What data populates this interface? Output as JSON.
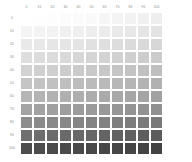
{
  "chart_data": {
    "type": "heatmap",
    "title": "",
    "subtitle": "",
    "xlabel": "",
    "ylabel": "",
    "legend": "none",
    "grid": false,
    "colormap": "greys",
    "colormap_min_hex": "#ffffff",
    "colormap_max_hex": "#454545",
    "x_axis_position": "top",
    "y_axis_position": "left",
    "xlim": [
      0,
      100
    ],
    "ylim": [
      0,
      100
    ],
    "categories": [
      "0",
      "10",
      "20",
      "30",
      "40",
      "50",
      "60",
      "70",
      "80",
      "90",
      "100"
    ],
    "row_categories": [
      "0",
      "10",
      "20",
      "30",
      "40",
      "50",
      "60",
      "70",
      "80",
      "90",
      "100"
    ],
    "x": [
      0,
      10,
      20,
      30,
      40,
      50,
      60,
      70,
      80,
      90,
      100
    ],
    "y": [
      0,
      10,
      20,
      30,
      40,
      50,
      60,
      70,
      80,
      90,
      100
    ],
    "values": [
      [
        0,
        1,
        2,
        3,
        4,
        5,
        6,
        7,
        8,
        9,
        10
      ],
      [
        10,
        11,
        12,
        13,
        14,
        15,
        16,
        17,
        18,
        19,
        20
      ],
      [
        20,
        21,
        22,
        23,
        24,
        25,
        26,
        27,
        28,
        29,
        30
      ],
      [
        30,
        31,
        32,
        33,
        34,
        35,
        36,
        37,
        38,
        39,
        40
      ],
      [
        40,
        41,
        42,
        43,
        44,
        45,
        46,
        47,
        48,
        49,
        50
      ],
      [
        50,
        51,
        52,
        53,
        54,
        55,
        56,
        57,
        58,
        59,
        60
      ],
      [
        60,
        61,
        62,
        63,
        64,
        65,
        66,
        67,
        68,
        69,
        70
      ],
      [
        70,
        71,
        72,
        73,
        74,
        75,
        76,
        77,
        78,
        79,
        80
      ],
      [
        80,
        81,
        82,
        83,
        84,
        85,
        86,
        87,
        88,
        89,
        90
      ],
      [
        90,
        91,
        92,
        93,
        94,
        95,
        96,
        97,
        98,
        99,
        100
      ],
      [
        100,
        101,
        102,
        103,
        104,
        105,
        106,
        107,
        108,
        109,
        110
      ]
    ],
    "cell_colors": [
      [
        "#ffffff",
        "#fefefe",
        "#fdfdfd",
        "#fbfbfb",
        "#fafafa",
        "#f9f9f9",
        "#f6f6f6",
        "#f4f4f4",
        "#f2f2f2",
        "#f0f0f0",
        "#eeeeee"
      ],
      [
        "#f4f4f4",
        "#f3f3f3",
        "#f2f2f2",
        "#f0f0f0",
        "#efefef",
        "#ededed",
        "#ebebeb",
        "#e9e9e9",
        "#e7e7e7",
        "#e5e5e5",
        "#e3e3e3"
      ],
      [
        "#e9e9e9",
        "#e8e8e8",
        "#e6e6e6",
        "#e5e5e5",
        "#e3e3e3",
        "#e1e1e1",
        "#dfdfdf",
        "#dddddd",
        "#dbdbdb",
        "#d9d9d9",
        "#d7d7d7"
      ],
      [
        "#dedede",
        "#dcdcdc",
        "#dbdbdb",
        "#d9d9d9",
        "#d7d7d7",
        "#d5d5d5",
        "#d3d3d3",
        "#d1d1d1",
        "#cfcfcf",
        "#cdcdcd",
        "#cbcbcb"
      ],
      [
        "#d2d2d2",
        "#d0d0d0",
        "#cfcfcf",
        "#cdcdcd",
        "#cbcbcb",
        "#c9c9c9",
        "#c7c7c7",
        "#c5c5c5",
        "#c3c3c3",
        "#c1c1c1",
        "#bfbfbf"
      ],
      [
        "#c5c5c5",
        "#c3c3c3",
        "#c1c1c1",
        "#bfbfbf",
        "#bdbdbd",
        "#bbbbbb",
        "#b9b9b9",
        "#b7b7b7",
        "#b5b5b5",
        "#b3b3b3",
        "#b1b1b1"
      ],
      [
        "#b6b6b6",
        "#b4b4b4",
        "#b2b2b2",
        "#b0b0b0",
        "#aeaeae",
        "#acacac",
        "#aaaaaa",
        "#a8a8a8",
        "#a6a6a6",
        "#a4a4a4",
        "#a2a2a2"
      ],
      [
        "#a4a4a4",
        "#a2a2a2",
        "#a0a0a0",
        "#9e9e9e",
        "#9c9c9c",
        "#9a9a9a",
        "#989898",
        "#969696",
        "#949494",
        "#929292",
        "#909090"
      ],
      [
        "#8d8d8d",
        "#8b8b8b",
        "#898989",
        "#878787",
        "#858585",
        "#838383",
        "#818181",
        "#7f7f7f",
        "#7d7d7d",
        "#7b7b7b",
        "#797979"
      ],
      [
        "#6f6f6f",
        "#6d6d6d",
        "#6b6b6b",
        "#6a6a6a",
        "#686868",
        "#666666",
        "#646464",
        "#626262",
        "#606060",
        "#5e5e5e",
        "#5c5c5c"
      ],
      [
        "#4d4d4d",
        "#4c4c4c",
        "#4b4b4b",
        "#4a4a4a",
        "#494949",
        "#484848",
        "#474747",
        "#464646",
        "#454545",
        "#444444",
        "#434343"
      ]
    ]
  }
}
